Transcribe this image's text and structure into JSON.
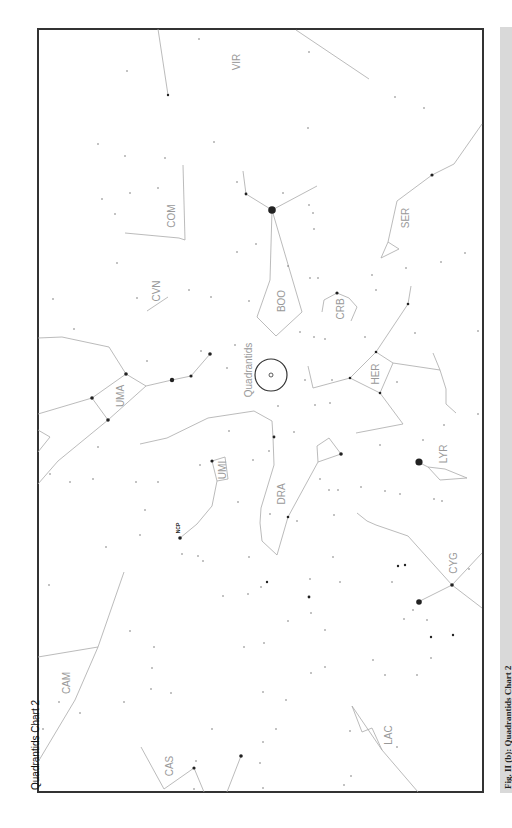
{
  "chart": {
    "title": "Quadrantids Chart 2",
    "radiant_label": "Quadrantids",
    "ncp_label": "NCP",
    "colors": {
      "border": "#333333",
      "lines": "#aaaaaa",
      "labels": "#999999",
      "stars": "#222222",
      "caption_bar": "#d9d9d9"
    }
  },
  "caption": {
    "text": "Fig. II (b): Quadrantids Chart 2"
  },
  "constellations": [
    {
      "id": "VIR",
      "label": "VIR",
      "x": 236,
      "y": 62
    },
    {
      "id": "COM",
      "label": "COM",
      "x": 171,
      "y": 216
    },
    {
      "id": "SER",
      "label": "SER",
      "x": 405,
      "y": 218
    },
    {
      "id": "CVN",
      "label": "CVN",
      "x": 156,
      "y": 291
    },
    {
      "id": "BOO",
      "label": "BOO",
      "x": 281,
      "y": 301
    },
    {
      "id": "CRB",
      "label": "CRB",
      "x": 340,
      "y": 309
    },
    {
      "id": "UMA",
      "label": "UMA",
      "x": 120,
      "y": 396
    },
    {
      "id": "HER",
      "label": "HER",
      "x": 375,
      "y": 374
    },
    {
      "id": "UMI",
      "label": "UMI",
      "x": 222,
      "y": 470
    },
    {
      "id": "LYR",
      "label": "LYR",
      "x": 443,
      "y": 454
    },
    {
      "id": "DRA",
      "label": "DRA",
      "x": 281,
      "y": 494
    },
    {
      "id": "CYG",
      "label": "CYG",
      "x": 453,
      "y": 563
    },
    {
      "id": "CAM",
      "label": "CAM",
      "x": 66,
      "y": 683
    },
    {
      "id": "LAC",
      "label": "LAC",
      "x": 388,
      "y": 735
    },
    {
      "id": "CAS",
      "label": "CAS",
      "x": 169,
      "y": 766
    }
  ],
  "radiant": {
    "x": 271,
    "y": 375,
    "r": 16
  }
}
